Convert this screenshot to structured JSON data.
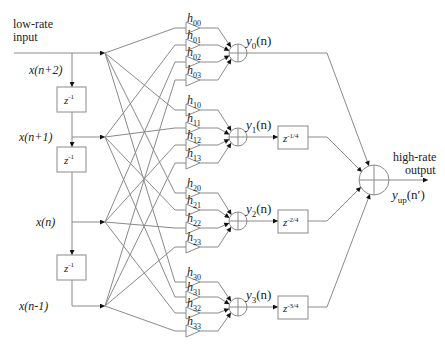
{
  "diagram": {
    "input_label_line1": "low-rate",
    "input_label_line2": "input",
    "output_label_line1": "high-rate",
    "output_label_line2": "output",
    "output_signal": {
      "base": "y",
      "sub": "up",
      "arg": "(n′)"
    },
    "delay_label": {
      "base": "z",
      "sup": "-1"
    },
    "taps": [
      {
        "label": "x(n+2)",
        "y": 53
      },
      {
        "label": "x(n+1)",
        "y": 137
      },
      {
        "label": "x(n)",
        "y": 222
      },
      {
        "label": "x(n-1)",
        "y": 306
      }
    ],
    "branches": [
      {
        "out_base": "y",
        "out_sub": "0",
        "out_arg": "(n)",
        "sum_y": 53,
        "filters": [
          {
            "sub": "00",
            "y": 28
          },
          {
            "sub": "01",
            "y": 45
          },
          {
            "sub": "02",
            "y": 62
          },
          {
            "sub": "03",
            "y": 80
          }
        ],
        "delay": null
      },
      {
        "out_base": "y",
        "out_sub": "1",
        "out_arg": "(n)",
        "sum_y": 137,
        "filters": [
          {
            "sub": "10",
            "y": 110
          },
          {
            "sub": "11",
            "y": 128
          },
          {
            "sub": "12",
            "y": 145
          },
          {
            "sub": "13",
            "y": 163
          }
        ],
        "delay": {
          "base": "z",
          "sup": "-1/4"
        }
      },
      {
        "out_base": "y",
        "out_sub": "2",
        "out_arg": "(n)",
        "sum_y": 221,
        "filters": [
          {
            "sub": "20",
            "y": 193
          },
          {
            "sub": "21",
            "y": 210
          },
          {
            "sub": "22",
            "y": 228
          },
          {
            "sub": "23",
            "y": 247
          }
        ],
        "delay": {
          "base": "z",
          "sup": "-2/4"
        }
      },
      {
        "out_base": "y",
        "out_sub": "3",
        "out_arg": "(n)",
        "sum_y": 307,
        "filters": [
          {
            "sub": "30",
            "y": 282
          },
          {
            "sub": "31",
            "y": 297
          },
          {
            "sub": "32",
            "y": 313
          },
          {
            "sub": "33",
            "y": 331
          }
        ],
        "delay": {
          "base": "z",
          "sup": "-3/4"
        }
      }
    ],
    "filter_base": "h",
    "colors": {
      "line": "#8a8a8a",
      "arrow": "#111111",
      "text": "#222222"
    }
  }
}
